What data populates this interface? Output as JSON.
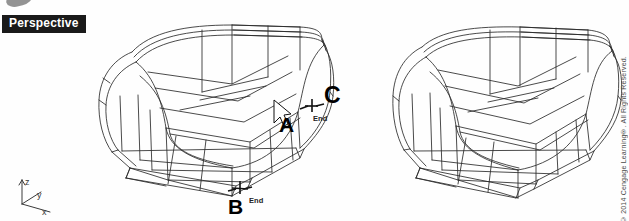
{
  "app": {
    "viewport_label": "Perspective",
    "background_color": "#ffffff",
    "wireframe_color": "#2b2b2b"
  },
  "ucs_icon": {
    "name": "ucs-axis-icon",
    "axes": [
      {
        "key": "z",
        "label": "z"
      },
      {
        "key": "y",
        "label": "y"
      },
      {
        "key": "x",
        "label": "x"
      }
    ]
  },
  "annotations": [
    {
      "id": "a",
      "label": "A",
      "note": "cursor pick point on front-right curved face"
    },
    {
      "id": "b",
      "label": "B",
      "note": "endpoint osnap at bottom front corner"
    },
    {
      "id": "c",
      "label": "C",
      "note": "endpoint osnap at right edge"
    }
  ],
  "osnap_tooltips": [
    {
      "id": "end-c",
      "label": "End"
    },
    {
      "id": "end-b",
      "label": "End"
    }
  ],
  "cursor": {
    "name": "crosshair-arrow-cursor",
    "type": "arrow"
  },
  "models": [
    {
      "id": "left-model",
      "label": "Wireframe solid before operation",
      "annotated": true
    },
    {
      "id": "right-model",
      "label": "Wireframe solid after operation",
      "annotated": false
    }
  ],
  "footer": {
    "copyright": "© 2014 Cengage Learning®. All Rights Reserved."
  }
}
